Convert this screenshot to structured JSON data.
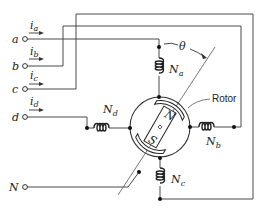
{
  "diagram": {
    "type": "four-phase stepper / reluctance motor winding schematic",
    "terminals": [
      {
        "id": "a",
        "label": "a",
        "current": "i",
        "current_sub": "a"
      },
      {
        "id": "b",
        "label": "b",
        "current": "i",
        "current_sub": "b"
      },
      {
        "id": "c",
        "label": "c",
        "current": "i",
        "current_sub": "c"
      },
      {
        "id": "d",
        "label": "d",
        "current": "i",
        "current_sub": "d"
      },
      {
        "id": "N",
        "label": "N"
      }
    ],
    "windings": [
      {
        "id": "Na",
        "label": "N",
        "sub": "a",
        "position": "top"
      },
      {
        "id": "Nb",
        "label": "N",
        "sub": "b",
        "position": "right"
      },
      {
        "id": "Nc",
        "label": "N",
        "sub": "c",
        "position": "bottom"
      },
      {
        "id": "Nd",
        "label": "N",
        "sub": "d",
        "position": "left"
      }
    ],
    "rotor": {
      "label": "Rotor",
      "north_pole": "N",
      "south_pole": "S"
    },
    "angle_label": "θ"
  }
}
